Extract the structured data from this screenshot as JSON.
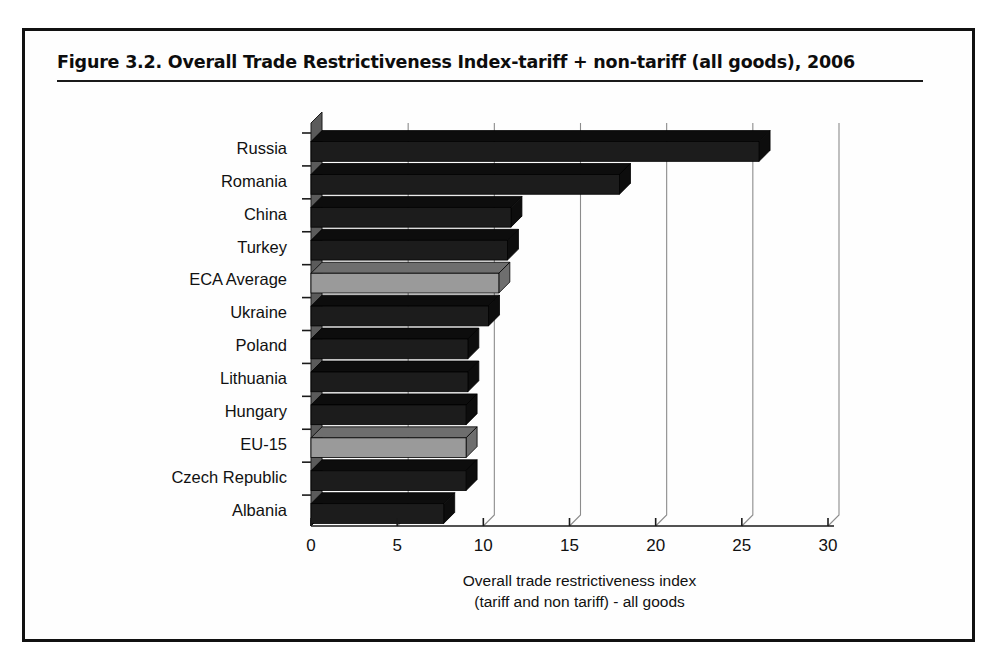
{
  "figure": {
    "title": "Figure 3.2.  Overall Trade Restrictiveness Index-tariff + non-tariff (all goods), 2006"
  },
  "chart_data": {
    "type": "bar",
    "orientation": "horizontal",
    "title": "Figure 3.2.  Overall Trade Restrictiveness Index-tariff + non-tariff (all goods), 2006",
    "xlabel_line1": "Overall trade restrictiveness index",
    "xlabel_line2": "(tariff and non tariff) - all goods",
    "ylabel": "",
    "categories": [
      "Russia",
      "Romania",
      "China",
      "Turkey",
      "ECA Average",
      "Ukraine",
      "Poland",
      "Lithuania",
      "Hungary",
      "EU-15",
      "Czech Republic",
      "Albania"
    ],
    "values": [
      26.0,
      17.9,
      11.6,
      11.4,
      10.9,
      10.3,
      9.1,
      9.1,
      9.0,
      9.0,
      9.0,
      7.7
    ],
    "bar_styles": [
      "dark",
      "dark",
      "dark",
      "dark",
      "light",
      "dark",
      "dark",
      "dark",
      "dark",
      "light",
      "dark",
      "dark"
    ],
    "xlim": [
      0,
      30
    ],
    "xticks": [
      0,
      5,
      10,
      15,
      20,
      25,
      30
    ],
    "xtick_labels": [
      "0",
      "5",
      "10",
      "15",
      "20",
      "25",
      "30"
    ],
    "grid": true,
    "gridlines_axis": "x",
    "legend": null,
    "style": "3d-horizontal-bar",
    "colors": {
      "bar_dark": "#1c1c1c",
      "bar_light": "#9a9a9a",
      "bar_dark_side": "#0d0d0d",
      "bar_light_side": "#6e6e6e",
      "gridline": "#8c8c8c",
      "axis": "#1a1a1a",
      "wall": "#5b5b5b",
      "background": "#ffffff",
      "text": "#111111"
    }
  }
}
